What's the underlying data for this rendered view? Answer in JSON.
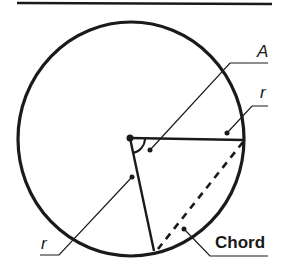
{
  "diagram": {
    "type": "geometry-circle-chord",
    "colors": {
      "stroke": "#1a1a1a",
      "background": "#ffffff"
    },
    "labels": {
      "angle": "A",
      "radius_top": "r",
      "radius_left": "r",
      "chord": "Chord"
    },
    "elements": [
      {
        "name": "top-rule",
        "description": "horizontal line at top"
      },
      {
        "name": "circle",
        "description": "circle outline"
      },
      {
        "name": "center-point",
        "description": "center dot"
      },
      {
        "name": "radius-horizontal",
        "label": "r"
      },
      {
        "name": "radius-lower",
        "label": "r"
      },
      {
        "name": "chord",
        "style": "dashed",
        "label": "Chord"
      },
      {
        "name": "angle-arc",
        "label": "A"
      }
    ]
  }
}
